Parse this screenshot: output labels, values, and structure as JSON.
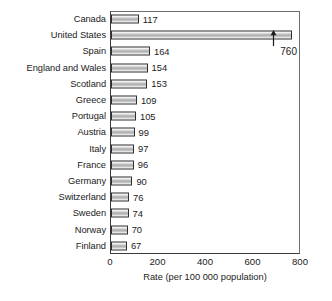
{
  "chart_data": {
    "type": "bar",
    "orientation": "horizontal",
    "title": "",
    "xlabel": "Rate (per 100 000 population)",
    "ylabel": "",
    "xlim": [
      0,
      800
    ],
    "xticks": [
      0,
      200,
      400,
      600,
      800
    ],
    "xticklabels": [
      "0",
      "200",
      "400",
      "600",
      "800"
    ],
    "grid": false,
    "legend": null,
    "categories": [
      "Canada",
      "United States",
      "Spain",
      "England and Wales",
      "Scotland",
      "Greece",
      "Portugal",
      "Austria",
      "Italy",
      "France",
      "Germany",
      "Switzerland",
      "Sweden",
      "Norway",
      "Finland"
    ],
    "values": [
      117,
      760,
      164,
      154,
      153,
      109,
      105,
      99,
      97,
      96,
      90,
      76,
      74,
      70,
      67
    ],
    "value_labels": [
      "117",
      "",
      "164",
      "154",
      "153",
      "109",
      "105",
      "99",
      "97",
      "96",
      "90",
      "76",
      "74",
      "70",
      "67"
    ],
    "annotations": [
      {
        "text": "760",
        "target_category": "United States",
        "target_value": 760,
        "style": "arrow-up"
      }
    ],
    "colors": {
      "bar_fill_light": "#f5f5f5",
      "bar_fill_dark": "#a9a9a9",
      "bar_border": "#2f2f2f",
      "axis": "#3a3a3a",
      "text": "#1b1b1b",
      "background": "#ffffff"
    }
  }
}
